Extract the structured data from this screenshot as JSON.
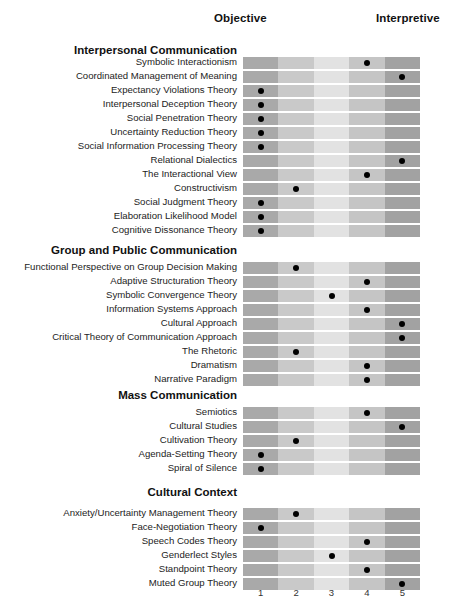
{
  "poles": {
    "left_label": "Objective",
    "right_label": "Interpretive"
  },
  "scale": {
    "ticks": [
      "1",
      "2",
      "3",
      "4",
      "5"
    ]
  },
  "chart_data": {
    "type": "heatmap",
    "title": "",
    "subtitle": "",
    "xlabel": "",
    "ylabel": "",
    "xlim": [
      1,
      5
    ],
    "grid": false,
    "legend": "none",
    "axis_poles": [
      "Objective",
      "Interpretive"
    ],
    "x_tick_labels": [
      "1",
      "2",
      "3",
      "4",
      "5"
    ],
    "cell_shades": [
      "#a9a9a9",
      "#c9c9c9",
      "#e2e2e2",
      "#c5c5c5",
      "#a2a2a2"
    ],
    "marker_color": "#000000",
    "sections": [
      {
        "name": "Interpersonal Communication",
        "rows": [
          {
            "label": "Symbolic Interactionism",
            "value": 4
          },
          {
            "label": "Coordinated Management of Meaning",
            "value": 5
          },
          {
            "label": "Expectancy Violations Theory",
            "value": 1
          },
          {
            "label": "Interpersonal Deception Theory",
            "value": 1
          },
          {
            "label": "Social Penetration Theory",
            "value": 1
          },
          {
            "label": "Uncertainty Reduction Theory",
            "value": 1
          },
          {
            "label": "Social Information Processing Theory",
            "value": 1
          },
          {
            "label": "Relational Dialectics",
            "value": 5
          },
          {
            "label": "The Interactional View",
            "value": 4
          },
          {
            "label": "Constructivism",
            "value": 2
          },
          {
            "label": "Social Judgment Theory",
            "value": 1
          },
          {
            "label": "Elaboration Likelihood Model",
            "value": 1
          },
          {
            "label": "Cognitive Dissonance Theory",
            "value": 1
          }
        ]
      },
      {
        "name": "Group and Public Communication",
        "rows": [
          {
            "label": "Functional Perspective on Group Decision Making",
            "value": 2
          },
          {
            "label": "Adaptive Structuration Theory",
            "value": 4
          },
          {
            "label": "Symbolic Convergence Theory",
            "value": 3
          },
          {
            "label": "Information Systems Approach",
            "value": 4
          },
          {
            "label": "Cultural Approach",
            "value": 5
          },
          {
            "label": "Critical Theory of Communication Approach",
            "value": 5
          },
          {
            "label": "The Rhetoric",
            "value": 2
          },
          {
            "label": "Dramatism",
            "value": 4
          },
          {
            "label": "Narrative Paradigm",
            "value": 4
          }
        ]
      },
      {
        "name": "Mass Communication",
        "rows": [
          {
            "label": "Semiotics",
            "value": 4
          },
          {
            "label": "Cultural Studies",
            "value": 5
          },
          {
            "label": "Cultivation Theory",
            "value": 2
          },
          {
            "label": "Agenda-Setting Theory",
            "value": 1
          },
          {
            "label": "Spiral of Silence",
            "value": 1
          }
        ]
      },
      {
        "name": "Cultural Context",
        "rows": [
          {
            "label": "Anxiety/Uncertainty Management Theory",
            "value": 2
          },
          {
            "label": "Face-Negotiation Theory",
            "value": 1
          },
          {
            "label": "Speech Codes Theory",
            "value": 4
          },
          {
            "label": "Genderlect Styles",
            "value": 3
          },
          {
            "label": "Standpoint Theory",
            "value": 4
          },
          {
            "label": "Muted Group Theory",
            "value": 5
          }
        ]
      }
    ]
  }
}
